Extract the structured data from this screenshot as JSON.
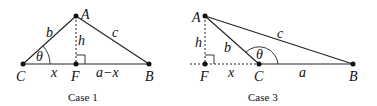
{
  "case1": {
    "caption": "Case 1",
    "points": {
      "A": "A",
      "B": "B",
      "C": "C",
      "F": "F"
    },
    "sides": {
      "b": "b",
      "c": "c",
      "h": "h",
      "x": "x",
      "a_minus_x": "a−x"
    },
    "angle": "θ"
  },
  "case3": {
    "caption": "Case 3",
    "points": {
      "A": "A",
      "B": "B",
      "C": "C",
      "F": "F"
    },
    "sides": {
      "b": "b",
      "c": "c",
      "h": "h",
      "x": "x",
      "a": "a"
    },
    "angle": "θ"
  }
}
